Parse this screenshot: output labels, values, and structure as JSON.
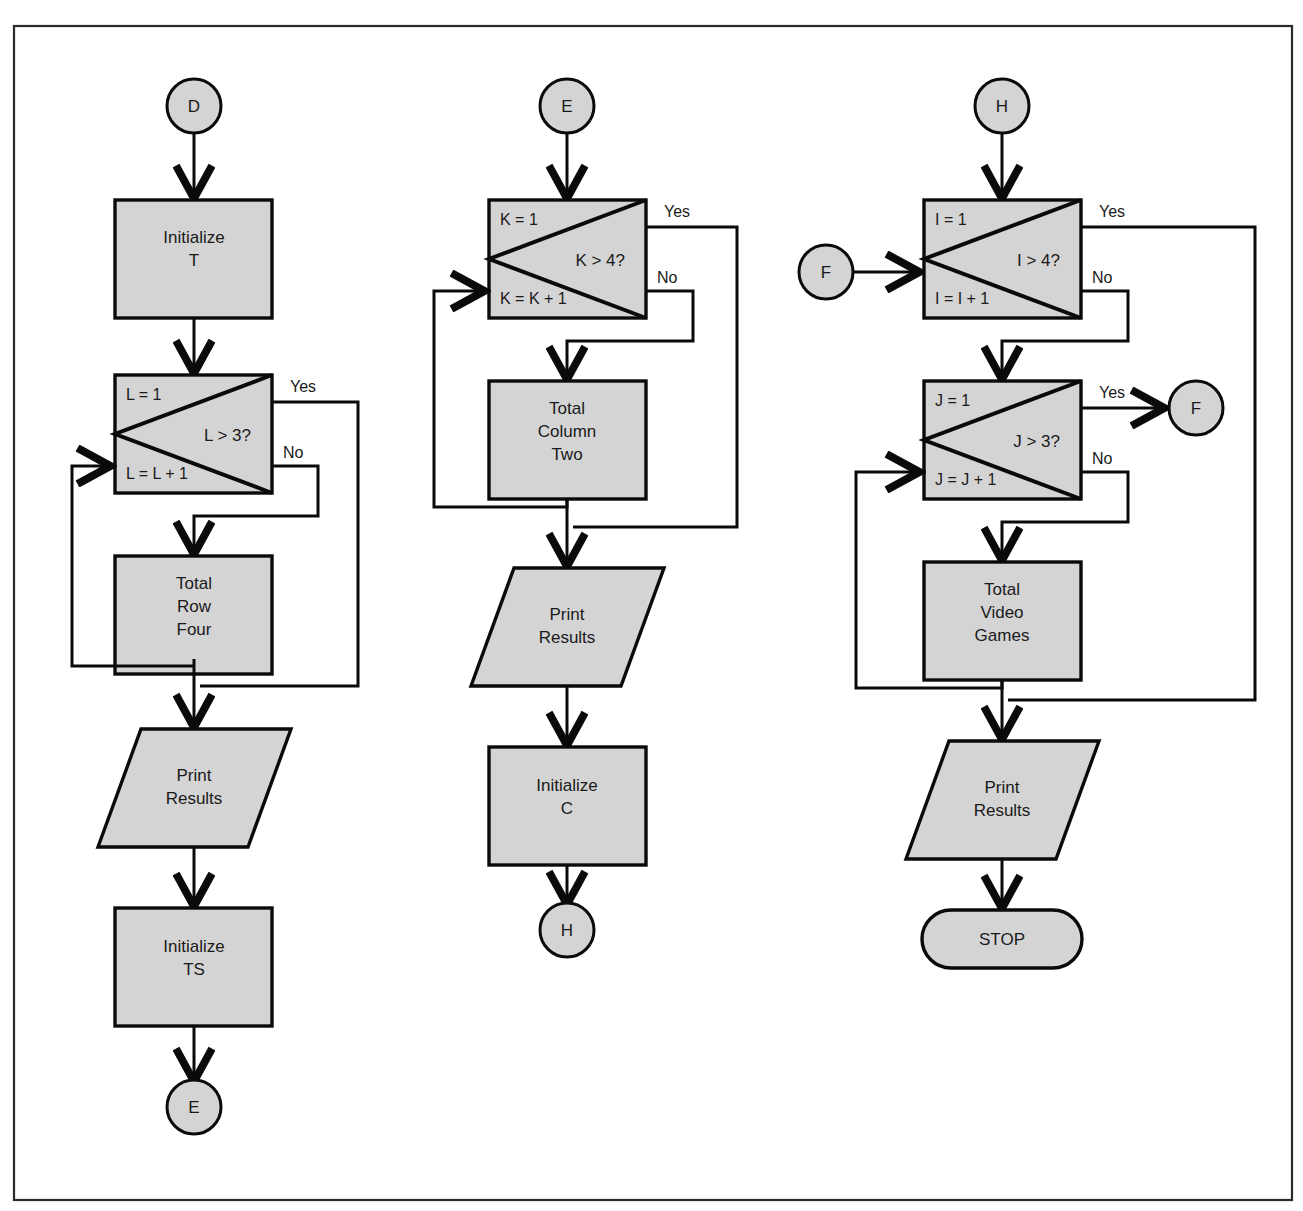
{
  "diagram": {
    "theme": {
      "shape_fill": "#d4d4d4",
      "stroke": "#0a0a0a",
      "text": "#1a1a1a",
      "background": "#ffffff",
      "border": "#2b2b2b"
    },
    "canvas": {
      "width": 1303,
      "height": 1211
    },
    "frame": {
      "x": 14,
      "y": 26,
      "width": 1278,
      "height": 1174
    }
  },
  "columns": [
    {
      "name": "column-one",
      "nodes": [
        {
          "id": "c1-conn-d",
          "type": "connector",
          "label": "D"
        },
        {
          "id": "c1-init-t",
          "type": "process",
          "label": "Initialize\nT",
          "lines": [
            "Initialize",
            "T"
          ]
        },
        {
          "id": "c1-loop-l",
          "type": "loop",
          "init": "L = 1",
          "increment": "L = L + 1",
          "condition": "L > 3?",
          "yes": "Yes",
          "no": "No"
        },
        {
          "id": "c1-total-row",
          "type": "process",
          "label": "Total\nRow\nFour",
          "lines": [
            "Total",
            "Row",
            "Four"
          ]
        },
        {
          "id": "c1-print",
          "type": "io",
          "label": "Print\nResults",
          "lines": [
            "Print",
            "Results"
          ]
        },
        {
          "id": "c1-init-ts",
          "type": "process",
          "label": "Initialize\nTS",
          "lines": [
            "Initialize",
            "TS"
          ]
        },
        {
          "id": "c1-conn-e",
          "type": "connector",
          "label": "E"
        }
      ]
    },
    {
      "name": "column-two",
      "nodes": [
        {
          "id": "c2-conn-e",
          "type": "connector",
          "label": "E"
        },
        {
          "id": "c2-loop-k",
          "type": "loop",
          "init": "K = 1",
          "increment": "K = K + 1",
          "condition": "K > 4?",
          "yes": "Yes",
          "no": "No"
        },
        {
          "id": "c2-total-col",
          "type": "process",
          "label": "Total\nColumn\nTwo",
          "lines": [
            "Total",
            "Column",
            "Two"
          ]
        },
        {
          "id": "c2-print",
          "type": "io",
          "label": "Print\nResults",
          "lines": [
            "Print",
            "Results"
          ]
        },
        {
          "id": "c2-init-c",
          "type": "process",
          "label": "Initialize\nC",
          "lines": [
            "Initialize",
            "C"
          ]
        },
        {
          "id": "c2-conn-h",
          "type": "connector",
          "label": "H"
        }
      ]
    },
    {
      "name": "column-three",
      "nodes": [
        {
          "id": "c3-conn-h",
          "type": "connector",
          "label": "H"
        },
        {
          "id": "c3-conn-f-in",
          "type": "connector",
          "label": "F"
        },
        {
          "id": "c3-loop-i",
          "type": "loop",
          "init": "I = 1",
          "increment": "I = I + 1",
          "condition": "I > 4?",
          "yes": "Yes",
          "no": "No"
        },
        {
          "id": "c3-loop-j",
          "type": "loop",
          "init": "J = 1",
          "increment": "J = J + 1",
          "condition": "J > 3?",
          "yes": "Yes",
          "no": "No"
        },
        {
          "id": "c3-conn-f-out",
          "type": "connector",
          "label": "F"
        },
        {
          "id": "c3-total-video",
          "type": "process",
          "label": "Total\nVideo\nGames",
          "lines": [
            "Total",
            "Video",
            "Games"
          ]
        },
        {
          "id": "c3-print",
          "type": "io",
          "label": "Print\nResults",
          "lines": [
            "Print",
            "Results"
          ]
        },
        {
          "id": "c3-stop",
          "type": "terminal",
          "label": "STOP"
        }
      ]
    }
  ],
  "branch_labels": {
    "yes": "Yes",
    "no": "No"
  }
}
